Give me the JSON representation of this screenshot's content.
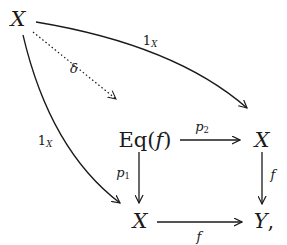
{
  "diagram": {
    "type": "commutative-diagram",
    "nodes": {
      "x_top": "X",
      "eq_prefix": "Eq(",
      "eq_arg": "f",
      "eq_suffix": ")",
      "x_right": "X",
      "x_bottom": "X",
      "y_bottom": "Y",
      "y_comma": ","
    },
    "labels": {
      "top_arrow_main": "1",
      "top_arrow_sub": "X",
      "dotted_arrow": "δ",
      "left_arrow_main": "1",
      "left_arrow_sub": "X",
      "p2_main": "p",
      "p2_sub": "2",
      "p1_main": "p",
      "p1_sub": "1",
      "right_vertical": "f",
      "bottom_horizontal": "f"
    },
    "edges": [
      {
        "from": "X (top-left)",
        "to": "X (right)",
        "label": "1_X",
        "style": "curved solid"
      },
      {
        "from": "X (top-left)",
        "to": "Eq(f)",
        "label": "δ",
        "style": "dotted"
      },
      {
        "from": "X (top-left)",
        "to": "X (bottom)",
        "label": "1_X",
        "style": "curved solid"
      },
      {
        "from": "Eq(f)",
        "to": "X (right)",
        "label": "p_2",
        "style": "solid"
      },
      {
        "from": "Eq(f)",
        "to": "X (bottom)",
        "label": "p_1",
        "style": "solid"
      },
      {
        "from": "X (right)",
        "to": "Y",
        "label": "f",
        "style": "solid"
      },
      {
        "from": "X (bottom)",
        "to": "Y",
        "label": "f",
        "style": "solid"
      }
    ],
    "colors": {
      "ink": "#1a1a1a",
      "background": "#ffffff"
    }
  }
}
